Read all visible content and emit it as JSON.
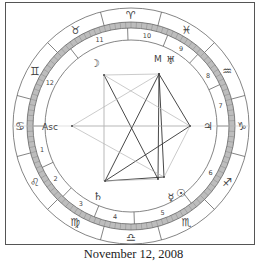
{
  "caption": "November 12, 2008",
  "colors": {
    "frame": "#555555",
    "ring_line": "#666666",
    "degree_fill": "#bdbdbd",
    "glyph": "#444444",
    "aspect_dark": "#333333",
    "aspect_light": "#b5b5b5"
  },
  "wheel": {
    "center": [
      131,
      126
    ],
    "r_outer": 118,
    "r_sign_inner": 104,
    "r_degree_inner": 98,
    "r_house_inner": 86,
    "r_aspect": 80
  },
  "signs": [
    {
      "name": "Aries",
      "glyph": "♈",
      "angle": 90
    },
    {
      "name": "Taurus",
      "glyph": "♉",
      "angle": 120
    },
    {
      "name": "Gemini",
      "glyph": "♊",
      "angle": 150
    },
    {
      "name": "Cancer",
      "glyph": "♋",
      "angle": 180
    },
    {
      "name": "Leo",
      "glyph": "♌",
      "angle": 210
    },
    {
      "name": "Virgo",
      "glyph": "♍",
      "angle": 240
    },
    {
      "name": "Libra",
      "glyph": "♎",
      "angle": 270
    },
    {
      "name": "Scorpio",
      "glyph": "♏",
      "angle": 300
    },
    {
      "name": "Sagittarius",
      "glyph": "♐",
      "angle": 330
    },
    {
      "name": "Capricorn",
      "glyph": "♑",
      "angle": 0
    },
    {
      "name": "Aquarius",
      "glyph": "♒",
      "angle": 30
    },
    {
      "name": "Pisces",
      "glyph": "♓",
      "angle": 60
    }
  ],
  "houses": [
    {
      "number": "1",
      "angle": 195
    },
    {
      "number": "2",
      "angle": 215
    },
    {
      "number": "3",
      "angle": 237
    },
    {
      "number": "4",
      "angle": 260
    },
    {
      "number": "5",
      "angle": 290
    },
    {
      "number": "6",
      "angle": 330
    },
    {
      "number": "7",
      "angle": 13
    },
    {
      "number": "8",
      "angle": 33
    },
    {
      "number": "9",
      "angle": 57
    },
    {
      "number": "10",
      "angle": 80
    },
    {
      "number": "11",
      "angle": 110
    },
    {
      "number": "12",
      "angle": 152
    }
  ],
  "house_cusps": [
    180,
    205,
    226,
    248,
    272,
    308,
    0,
    25,
    47,
    68,
    92,
    128
  ],
  "planets": [
    {
      "name": "Ascendant",
      "label": "Asc",
      "x": 50,
      "y": 126,
      "dot": [
        72,
        126
      ]
    },
    {
      "name": "Moon",
      "glyph": "☽",
      "x": 95,
      "y": 63,
      "dot": [
        104,
        75
      ]
    },
    {
      "name": "Mars",
      "label": "M",
      "x": 158,
      "y": 58,
      "dot": [
        159,
        74
      ]
    },
    {
      "name": "Uranus",
      "glyph": "♅",
      "x": 171,
      "y": 60,
      "dot": [
        159,
        74
      ]
    },
    {
      "name": "Jupiter",
      "glyph": "♃",
      "x": 208,
      "y": 126,
      "dot": [
        190,
        126
      ]
    },
    {
      "name": "Saturn",
      "glyph": "♄",
      "x": 98,
      "y": 196,
      "dot": [
        105,
        181
      ]
    },
    {
      "name": "Mercury",
      "glyph": "☿",
      "x": 171,
      "y": 197,
      "dot": [
        158,
        179
      ]
    },
    {
      "name": "Sun",
      "glyph": "☉",
      "x": 181,
      "y": 193,
      "dot": [
        164,
        177
      ]
    }
  ],
  "aspects": [
    {
      "from": [
        159,
        74
      ],
      "to": [
        105,
        181
      ],
      "style": "dark"
    },
    {
      "from": [
        159,
        74
      ],
      "to": [
        158,
        179
      ],
      "style": "dark"
    },
    {
      "from": [
        159,
        74
      ],
      "to": [
        164,
        177
      ],
      "style": "dark"
    },
    {
      "from": [
        159,
        74
      ],
      "to": [
        190,
        126
      ],
      "style": "dark"
    },
    {
      "from": [
        104,
        75
      ],
      "to": [
        158,
        179
      ],
      "style": "dark"
    },
    {
      "from": [
        105,
        181
      ],
      "to": [
        190,
        126
      ],
      "style": "dark"
    },
    {
      "from": [
        105,
        181
      ],
      "to": [
        164,
        177
      ],
      "style": "dark"
    },
    {
      "from": [
        104,
        75
      ],
      "to": [
        159,
        74
      ],
      "style": "light"
    },
    {
      "from": [
        104,
        75
      ],
      "to": [
        190,
        126
      ],
      "style": "light"
    },
    {
      "from": [
        104,
        75
      ],
      "to": [
        104,
        181
      ],
      "style": "light"
    },
    {
      "from": [
        72,
        126
      ],
      "to": [
        159,
        74
      ],
      "style": "light"
    },
    {
      "from": [
        72,
        126
      ],
      "to": [
        190,
        126
      ],
      "style": "light"
    },
    {
      "from": [
        72,
        126
      ],
      "to": [
        164,
        177
      ],
      "style": "light"
    },
    {
      "from": [
        190,
        126
      ],
      "to": [
        164,
        177
      ],
      "style": "light"
    },
    {
      "from": [
        105,
        181
      ],
      "to": [
        158,
        179
      ],
      "style": "light"
    }
  ]
}
